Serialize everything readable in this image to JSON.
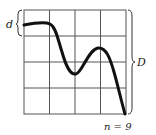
{
  "diagram": {
    "grid": {
      "cols": 4,
      "rows": 4,
      "x0": 24,
      "y0": 10,
      "x1": 126,
      "y1": 114,
      "line_color": "#555555"
    },
    "curve": {
      "color": "#111111",
      "points": [
        [
          24,
          24
        ],
        [
          34,
          22
        ],
        [
          48,
          22
        ],
        [
          54,
          28
        ],
        [
          60,
          50
        ],
        [
          66,
          68
        ],
        [
          72,
          74
        ],
        [
          80,
          66
        ],
        [
          88,
          52
        ],
        [
          96,
          48
        ],
        [
          104,
          58
        ],
        [
          112,
          80
        ],
        [
          120,
          104
        ],
        [
          124,
          114
        ]
      ]
    },
    "labels": {
      "d": "d",
      "D": "D",
      "n": "n = 9"
    }
  }
}
